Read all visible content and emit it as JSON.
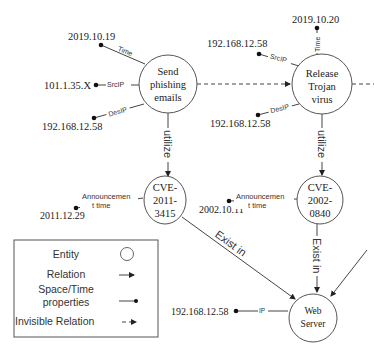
{
  "diagram": {
    "nodes": {
      "send_phishing": {
        "lines": [
          "Send",
          "phishing",
          "emails"
        ]
      },
      "release_trojan": {
        "lines": [
          "Release",
          "Trojan",
          "virus"
        ]
      },
      "cve_2011": {
        "lines": [
          "CVE-",
          "2011-",
          "3415"
        ]
      },
      "cve_2002": {
        "lines": [
          "CVE-",
          "2002-",
          "0840"
        ]
      },
      "web_server": {
        "lines": [
          "Web",
          "Server"
        ]
      }
    },
    "properties": {
      "phish_time": {
        "value": "2019.10.19",
        "label": "Time"
      },
      "phish_srcip": {
        "value": "101.1.35.X",
        "label": "SrcIP"
      },
      "phish_desip": {
        "value": "192.168.12.58",
        "label": "DesIP"
      },
      "trojan_time": {
        "value": "2019.10.20",
        "label": "Time"
      },
      "trojan_srcip": {
        "value": "192.168.12.58",
        "label": "SrcIP"
      },
      "trojan_desip": {
        "value": "192.168.12.58",
        "label": "DesIP"
      },
      "cve2011_announce": {
        "value": "2011.12.29",
        "label_lines": [
          "Announcemen",
          "t time"
        ]
      },
      "cve2002_announce": {
        "value": "2002.10.11",
        "label_lines": [
          "Announcemen",
          "t time"
        ]
      },
      "webserver_ip": {
        "value": "192.168.12.58",
        "label": "IP"
      }
    },
    "relations": {
      "utilize_1": "utilize",
      "utilize_2": "utilize",
      "exist_in_1": "Exist in",
      "exist_in_2": "Exist in"
    },
    "legend": {
      "entity": "Entity",
      "relation": "Relation",
      "spacetime_lines": [
        "Space/Time",
        "properties"
      ],
      "invisible": "Invisible Relation"
    }
  }
}
